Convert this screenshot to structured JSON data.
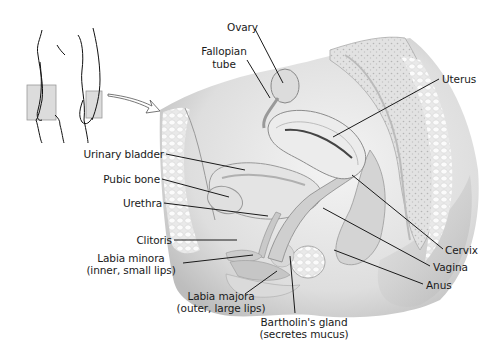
{
  "diagram": {
    "type": "anatomical-illustration",
    "inset": {
      "description": "Front and side body outlines with shaded pelvic region box and arrow pointing to main section"
    },
    "labels": {
      "ovary": "Ovary",
      "fallopian_tube_1": "Fallopian",
      "fallopian_tube_2": "tube",
      "uterus": "Uterus",
      "urinary_bladder": "Urinary bladder",
      "pubic_bone": "Pubic bone",
      "urethra": "Urethra",
      "clitoris": "Clitoris",
      "labia_minora_1": "Labia minora",
      "labia_minora_2": "(inner, small lips)",
      "labia_majora_1": "Labia majora",
      "labia_majora_2": "(outer, large lips)",
      "bartholin_1": "Bartholin's gland",
      "bartholin_2": "(secretes mucus)",
      "cervix": "Cervix",
      "vagina": "Vagina",
      "anus": "Anus"
    },
    "colors": {
      "background": "#ffffff",
      "text": "#1a1a1a",
      "leader_line": "#1a1a1a",
      "tissue_light": "#ececec",
      "tissue_mid": "#cfcfcf",
      "tissue_dark": "#a9a9a9",
      "inset_box": "#d9d9d9"
    }
  }
}
